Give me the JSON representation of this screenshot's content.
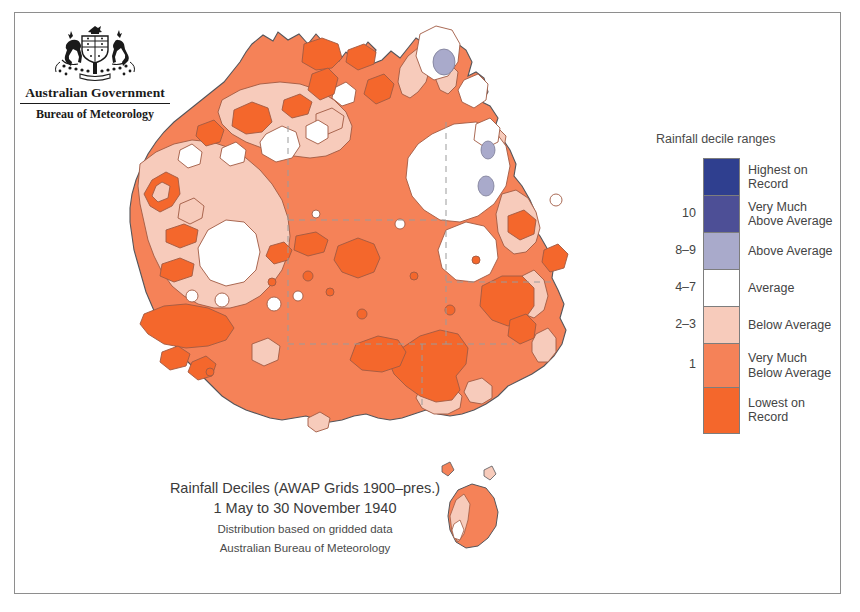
{
  "branding": {
    "crest_icon": "australian-coat-of-arms-icon",
    "government_line": "Australian Government",
    "agency_line": "Bureau of Meteorology"
  },
  "caption": {
    "line1": "Rainfall Deciles (AWAP Grids 1900–pres.)",
    "line2": "1 May to 30 November 1940",
    "line3": "Distribution based on gridded data",
    "line4": "Australian Bureau of Meteorology"
  },
  "legend": {
    "title": "Rainfall decile ranges",
    "entries": [
      {
        "decile": "",
        "label": "Highest on Record",
        "label_l1": "Highest on",
        "label_l2": "Record",
        "color": "#2f3f8f",
        "height": 37
      },
      {
        "decile": "10",
        "label": "Very Much Above Average",
        "label_l1": "Very Much",
        "label_l2": "Above Average",
        "color": "#4d4f96",
        "height": 37
      },
      {
        "decile": "8–9",
        "label": "Above Average",
        "label_l1": "Above Average",
        "label_l2": "",
        "color": "#a9aacb",
        "height": 37
      },
      {
        "decile": "4–7",
        "label": "Average",
        "label_l1": "Average",
        "label_l2": "",
        "color": "#ffffff",
        "height": 37
      },
      {
        "decile": "2–3",
        "label": "Below Average",
        "label_l1": "Below Average",
        "label_l2": "",
        "color": "#f7cbbb",
        "height": 37
      },
      {
        "decile": "1",
        "label": "Very Much Below Average",
        "label_l1": "Very Much",
        "label_l2": "Below Average",
        "color": "#f58258",
        "height": 44
      },
      {
        "decile": "",
        "label": "Lowest on Record",
        "label_l1": "Lowest on",
        "label_l2": "Record",
        "color": "#f4672c",
        "height": 45
      }
    ]
  },
  "chart_data": {
    "type": "map",
    "title": "Rainfall Deciles (AWAP Grids 1900–pres.)",
    "subtitle": "1 May to 30 November 1940",
    "region": "Australia",
    "variable": "Rainfall decile ranges",
    "period_start": "1 May 1940",
    "period_end": "30 November 1940",
    "source": "Australian Bureau of Meteorology",
    "method": "Distribution based on gridded data",
    "classes": [
      {
        "decile": "",
        "label": "Highest on Record",
        "color": "#2f3f8f"
      },
      {
        "decile": "10",
        "label": "Very Much Above Average",
        "color": "#4d4f96"
      },
      {
        "decile": "8-9",
        "label": "Above Average",
        "color": "#a9aacb"
      },
      {
        "decile": "4-7",
        "label": "Average",
        "color": "#ffffff"
      },
      {
        "decile": "2-3",
        "label": "Below Average",
        "color": "#f7cbbb"
      },
      {
        "decile": "1",
        "label": "Very Much Below Average",
        "color": "#f58258"
      },
      {
        "decile": "",
        "label": "Lowest on Record",
        "color": "#f4672c"
      }
    ],
    "dominant_class": "Very Much Below Average"
  },
  "colors": {
    "highest_on_record": "#2f3f8f",
    "very_much_above_average": "#4d4f96",
    "above_average": "#a9aacb",
    "average": "#ffffff",
    "below_average": "#f7cbbb",
    "very_much_below_average": "#f58258",
    "lowest_on_record": "#f4672c",
    "coastline": "#55555a",
    "contour": "#a05a43",
    "state_border": "#9b9b9b",
    "frame": "#8e8e8e"
  }
}
